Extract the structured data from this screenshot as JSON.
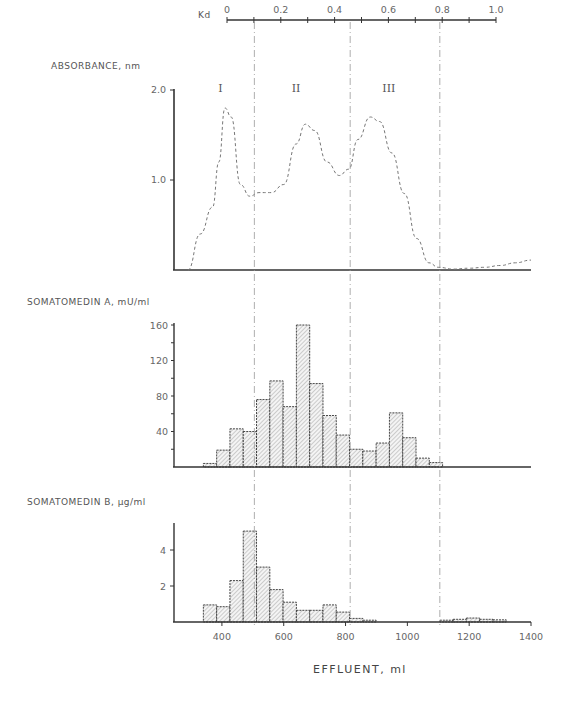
{
  "figure": {
    "kd_axis": {
      "label": "Kd",
      "ticks": [
        "0",
        "0.2",
        "0.4",
        "0.6",
        "0.8",
        "1.0"
      ]
    },
    "x_title": "EFFLUENT, ml",
    "x_ticks": [
      "400",
      "600",
      "800",
      "1000",
      "1200",
      "1400"
    ],
    "panel_a": {
      "title": "ABSORBANCE, nm",
      "y_ticks": [
        "1.0",
        "2.0"
      ],
      "regions": [
        "I",
        "II",
        "III"
      ]
    },
    "panel_b": {
      "title": "SOMATOMEDIN A, mU/ml",
      "y_ticks": [
        "40",
        "80",
        "120",
        "160"
      ]
    },
    "panel_c": {
      "title": "SOMATOMEDIN B, µg/ml",
      "y_ticks": [
        "2",
        "4"
      ]
    }
  },
  "chart_data": [
    {
      "type": "line",
      "title": "ABSORBANCE, nm",
      "xlabel": "EFFLUENT, ml",
      "ylabel": "Absorbance",
      "xlim": [
        250,
        1400
      ],
      "ylim": [
        0,
        2.0
      ],
      "style": "dashed",
      "x": [
        290,
        330,
        370,
        390,
        410,
        430,
        460,
        490,
        520,
        560,
        600,
        640,
        670,
        700,
        740,
        780,
        810,
        840,
        880,
        910,
        950,
        990,
        1030,
        1070,
        1100,
        1150,
        1200,
        1250,
        1300,
        1350,
        1400
      ],
      "values": [
        0.0,
        0.4,
        0.7,
        1.2,
        1.8,
        1.7,
        0.95,
        0.82,
        0.86,
        0.86,
        0.95,
        1.4,
        1.62,
        1.55,
        1.2,
        1.05,
        1.12,
        1.45,
        1.7,
        1.65,
        1.3,
        0.85,
        0.35,
        0.08,
        0.03,
        0.01,
        0.02,
        0.03,
        0.05,
        0.08,
        0.11
      ],
      "annotations": [
        {
          "text": "I",
          "x": 395
        },
        {
          "text": "II",
          "x": 640
        },
        {
          "text": "III",
          "x": 940
        }
      ],
      "secondary_axis": {
        "label": "Kd",
        "range": [
          0,
          1.0
        ],
        "ticks": [
          0,
          0.2,
          0.4,
          0.6,
          0.8,
          1.0
        ]
      },
      "vertical_markers_ml": [
        505,
        815,
        1105
      ]
    },
    {
      "type": "bar",
      "title": "SOMATOMEDIN A, mU/ml",
      "xlabel": "EFFLUENT, ml",
      "ylabel": "mU/ml",
      "xlim": [
        250,
        1400
      ],
      "ylim": [
        0,
        165
      ],
      "bin_width_ml": 43,
      "x_start_ml": [
        340,
        383,
        426,
        469,
        512,
        555,
        598,
        641,
        684,
        727,
        770,
        813,
        856,
        899,
        942,
        985,
        1028,
        1071
      ],
      "values": [
        4,
        19,
        43,
        40,
        76,
        97,
        68,
        160,
        94,
        58,
        36,
        20,
        18,
        27,
        61,
        33,
        10,
        5
      ],
      "grid": false
    },
    {
      "type": "bar",
      "title": "SOMATOMEDIN B, µg/ml",
      "xlabel": "EFFLUENT, ml",
      "ylabel": "µg/ml",
      "xlim": [
        250,
        1400
      ],
      "ylim": [
        0,
        5.5
      ],
      "bin_width_ml": 43,
      "x_start_ml": [
        340,
        383,
        426,
        469,
        512,
        555,
        598,
        641,
        684,
        727,
        770,
        813,
        856,
        1105,
        1148,
        1191,
        1234,
        1277
      ],
      "values": [
        0.95,
        0.85,
        2.3,
        5.05,
        3.05,
        1.8,
        1.1,
        0.65,
        0.65,
        0.95,
        0.55,
        0.2,
        0.1,
        0.1,
        0.15,
        0.22,
        0.15,
        0.12
      ],
      "grid": false
    }
  ]
}
